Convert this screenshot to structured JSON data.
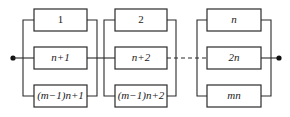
{
  "diagram": {
    "type": "series-parallel reliability block diagram",
    "groups": [
      {
        "name": "group-1",
        "blocks": [
          {
            "label": "1"
          },
          {
            "label": "n+1"
          },
          {
            "label": "(m−1)n+1"
          }
        ]
      },
      {
        "name": "group-2",
        "blocks": [
          {
            "label": "2"
          },
          {
            "label": "n+2"
          },
          {
            "label": "(m−1)n+2"
          }
        ]
      },
      {
        "name": "group-n",
        "blocks": [
          {
            "label": "n"
          },
          {
            "label": "2n"
          },
          {
            "label": "mn"
          }
        ]
      }
    ],
    "connector_between_group2_and_groupn": "dashed",
    "terminals": [
      "input-node",
      "output-node"
    ],
    "colors": {
      "line": "#2a2a2a",
      "background": "#ffffff"
    }
  }
}
